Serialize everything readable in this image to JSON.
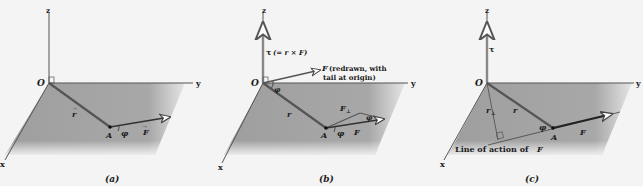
{
  "figure": {
    "colors": {
      "background": "#f4f4f4",
      "plane": "#a9a9a9",
      "axis": "#555555",
      "vector": "#3a3a3a",
      "label": "#1a1a1a"
    },
    "panels": [
      {
        "id": "a",
        "caption": "(a)",
        "axes": {
          "z": "z",
          "y": "y",
          "x": "x",
          "origin": "O"
        },
        "labels": {
          "r": "r",
          "point": "A",
          "angle": "φ",
          "force": "F"
        }
      },
      {
        "id": "b",
        "caption": "(b)",
        "axes": {
          "z": "z",
          "y": "y",
          "x": "x",
          "origin": "O"
        },
        "labels": {
          "torque": "τ (= r × F)",
          "torque_prefix": "τ",
          "torque_eq": "(= r × F)",
          "f_redrawn_1": "(redrawn, with",
          "f_redrawn_2": "tail at origin)",
          "f_redrawn_symbol": "F",
          "angle_origin": "φ",
          "r": "r",
          "f_perp": "F",
          "f_perp_sub": "⊥",
          "angle_tip": "φ",
          "point": "A",
          "angle_a": "φ",
          "force": "F"
        }
      },
      {
        "id": "c",
        "caption": "(c)",
        "axes": {
          "z": "z",
          "y": "y",
          "x": "x",
          "origin": "O"
        },
        "labels": {
          "torque": "τ",
          "r_perp": "r",
          "r_perp_sub": "⊥",
          "r": "r",
          "angle": "φ",
          "point": "A",
          "force": "F",
          "line_of_action": "Line of action of ",
          "line_of_action_symbol": "F"
        }
      }
    ]
  }
}
